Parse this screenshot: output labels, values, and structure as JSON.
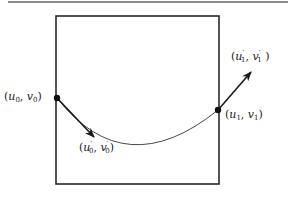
{
  "figure": {
    "top_rule_color": "#8a8a8a",
    "stroke_color": "#2a2a2a",
    "box": {
      "x": 56,
      "y": 16,
      "width": 163,
      "height": 168
    },
    "curve": {
      "start": [
        57,
        98
      ],
      "control": [
        125,
        172
      ],
      "end": [
        218,
        110
      ],
      "min_point_approx": [
        145,
        141
      ]
    },
    "points": [
      {
        "id": "p0",
        "x": 57,
        "y": 98
      },
      {
        "id": "p1",
        "x": 218,
        "y": 110
      }
    ],
    "tangents": [
      {
        "id": "t0",
        "from": [
          57,
          98
        ],
        "to": [
          94,
          137
        ]
      },
      {
        "id": "t1",
        "from": [
          218,
          110
        ],
        "to": [
          251,
          72
        ]
      }
    ],
    "labels": {
      "p0": {
        "u": "u",
        "u_sub": "0",
        "v": "v",
        "v_sub": "0",
        "x": 4,
        "y": 92
      },
      "p1": {
        "u": "u",
        "u_sub": "1",
        "v": "v",
        "v_sub": "1",
        "x": 222,
        "y": 110
      },
      "t0": {
        "u": "u",
        "u_sub": "0",
        "v": "v",
        "v_sub": "0",
        "prime": "′",
        "x": 78,
        "y": 142
      },
      "t1": {
        "u": "u",
        "u_sub": "1",
        "v": "v",
        "v_sub": "1",
        "prime": "′",
        "x": 230,
        "y": 50
      }
    }
  }
}
